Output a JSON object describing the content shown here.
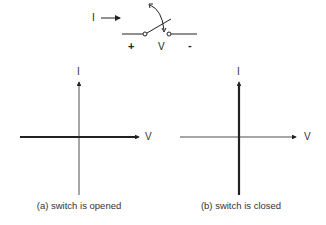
{
  "circuit": {
    "current_label": "I",
    "plus_label": "+",
    "voltage_label": "V",
    "minus_label": "-"
  },
  "graph_a": {
    "y_axis_label": "I",
    "x_axis_label": "V",
    "caption": "(a) switch is opened",
    "highlight": "horizontal axis (I = 0 for all V)"
  },
  "graph_b": {
    "y_axis_label": "I",
    "x_axis_label": "V",
    "caption": "(b) switch is closed",
    "highlight": "vertical axis (V = 0 for all I)"
  },
  "colors": {
    "line": "#222222",
    "background": "#ffffff"
  }
}
